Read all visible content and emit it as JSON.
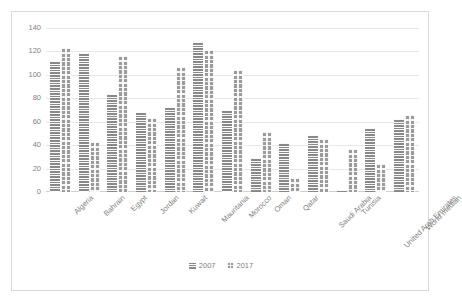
{
  "chart_data": {
    "type": "bar",
    "title": "",
    "subtitle": "",
    "xlabel": "",
    "ylabel": "",
    "ylim": [
      0,
      140
    ],
    "yticks": [
      0,
      20,
      40,
      60,
      80,
      100,
      120,
      140
    ],
    "grid": true,
    "legend_position": "bottom",
    "categories": [
      "Algeria",
      "Bahrain",
      "Egypt",
      "Jordan",
      "Kuwait",
      "Mauritania",
      "Morocco",
      "Oman",
      "Qatar",
      "Saudi Arabia",
      "Tunisia",
      "United Arab Emirates",
      "World median"
    ],
    "series": [
      {
        "name": "2007",
        "color": "#898989",
        "pattern": "horizontal-stripes",
        "values": [
          112,
          119,
          84,
          68,
          73,
          128,
          70,
          29,
          42,
          49,
          2,
          55,
          62
        ]
      },
      {
        "name": "2017",
        "color": "#9b9b9b",
        "pattern": "checkered",
        "values": [
          123,
          43,
          116,
          63,
          107,
          121,
          104,
          51,
          12,
          45,
          37,
          24,
          66
        ]
      }
    ]
  },
  "axes": {
    "y_tick_labels": [
      "140",
      "120",
      "100",
      "80",
      "60",
      "40",
      "20",
      "0"
    ]
  },
  "legend": {
    "items": [
      {
        "label": "2007"
      },
      {
        "label": "2017"
      }
    ]
  }
}
